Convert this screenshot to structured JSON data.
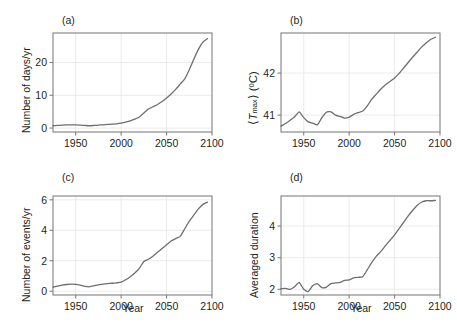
{
  "figure": {
    "panel_count": 4,
    "line_color": "#6e6e6e",
    "frame_color": "#808080",
    "grid_color": "#e6e6e6",
    "background": "#ffffff"
  },
  "panels": {
    "a": {
      "label": "(a)",
      "ylabel": "Number of days/yr",
      "xlabel": "",
      "ytick_labels": [
        "0",
        "10",
        "20"
      ],
      "xtick_labels": [
        "1950",
        "2000",
        "2050",
        "2100"
      ]
    },
    "b": {
      "label": "(b)",
      "ylabel_open": "⟨",
      "ylabel_t": "T",
      "ylabel_sub": "max",
      "ylabel_close": "⟩ (ºC)",
      "ylabel": "⟨Tmax⟩ (ºC)",
      "xlabel": "",
      "ytick_labels": [
        "41",
        "42"
      ],
      "xtick_labels": [
        "1950",
        "2000",
        "2050",
        "2100"
      ]
    },
    "c": {
      "label": "(c)",
      "ylabel": "Number of events/yr",
      "xlabel": "Year",
      "ytick_labels": [
        "0",
        "2",
        "4",
        "6"
      ],
      "xtick_labels": [
        "1950",
        "2000",
        "2050",
        "2100"
      ]
    },
    "d": {
      "label": "(d)",
      "ylabel": "Averaged duration",
      "xlabel": "Year",
      "ytick_labels": [
        "2",
        "3",
        "4"
      ],
      "xtick_labels": [
        "1950",
        "2000",
        "2050",
        "2100"
      ]
    }
  },
  "chart_data": [
    {
      "type": "line",
      "panel": "a",
      "title": "(a)",
      "xlabel": "",
      "ylabel": "Number of days/yr",
      "xlim": [
        1925,
        2100
      ],
      "ylim": [
        -1.2,
        29
      ],
      "xticks": [
        1950,
        2000,
        2050,
        2100
      ],
      "yticks": [
        0,
        10,
        20
      ],
      "grid": true,
      "legend": "none",
      "x": [
        1925,
        1930,
        1935,
        1940,
        1945,
        1950,
        1955,
        1960,
        1965,
        1970,
        1975,
        1980,
        1985,
        1990,
        1995,
        2000,
        2005,
        2010,
        2015,
        2020,
        2025,
        2030,
        2035,
        2040,
        2045,
        2050,
        2055,
        2060,
        2065,
        2070,
        2075,
        2080,
        2085,
        2090,
        2095
      ],
      "values": [
        0.7,
        0.8,
        0.9,
        1.0,
        1.0,
        1.0,
        0.9,
        0.8,
        0.7,
        0.8,
        0.9,
        1.0,
        1.1,
        1.2,
        1.3,
        1.5,
        1.8,
        2.2,
        2.7,
        3.4,
        4.6,
        5.8,
        6.5,
        7.2,
        8.1,
        9.2,
        10.4,
        11.8,
        13.4,
        15.0,
        17.8,
        21.0,
        24.0,
        26.2,
        27.3
      ]
    },
    {
      "type": "line",
      "panel": "b",
      "title": "(b)",
      "xlabel": "",
      "ylabel": "⟨Tmax⟩ (ºC)",
      "xlim": [
        1925,
        2100
      ],
      "ylim": [
        40.6,
        42.95
      ],
      "xticks": [
        1950,
        2000,
        2050,
        2100
      ],
      "yticks": [
        41,
        42
      ],
      "grid": true,
      "legend": "none",
      "x": [
        1925,
        1930,
        1935,
        1940,
        1945,
        1950,
        1955,
        1960,
        1965,
        1970,
        1975,
        1980,
        1985,
        1990,
        1995,
        2000,
        2005,
        2010,
        2015,
        2020,
        2025,
        2030,
        2035,
        2040,
        2045,
        2050,
        2055,
        2060,
        2065,
        2070,
        2075,
        2080,
        2085,
        2090,
        2095
      ],
      "values": [
        40.74,
        40.8,
        40.88,
        40.96,
        41.08,
        40.94,
        40.84,
        40.81,
        40.77,
        40.94,
        41.07,
        41.08,
        41.0,
        40.97,
        40.93,
        40.95,
        41.02,
        41.06,
        41.1,
        41.22,
        41.38,
        41.5,
        41.62,
        41.72,
        41.8,
        41.88,
        41.99,
        42.12,
        42.25,
        42.38,
        42.5,
        42.62,
        42.72,
        42.8,
        42.85
      ]
    },
    {
      "type": "line",
      "panel": "c",
      "title": "(c)",
      "xlabel": "Year",
      "ylabel": "Number of events/yr",
      "xlim": [
        1925,
        2100
      ],
      "ylim": [
        -0.25,
        6.25
      ],
      "xticks": [
        1950,
        2000,
        2050,
        2100
      ],
      "yticks": [
        0,
        2,
        4,
        6
      ],
      "grid": true,
      "legend": "none",
      "x": [
        1925,
        1930,
        1935,
        1940,
        1945,
        1950,
        1955,
        1960,
        1965,
        1970,
        1975,
        1980,
        1985,
        1990,
        1995,
        2000,
        2005,
        2010,
        2015,
        2020,
        2025,
        2030,
        2035,
        2040,
        2045,
        2050,
        2055,
        2060,
        2065,
        2070,
        2075,
        2080,
        2085,
        2090,
        2095
      ],
      "values": [
        0.26,
        0.34,
        0.4,
        0.44,
        0.46,
        0.45,
        0.4,
        0.32,
        0.29,
        0.35,
        0.42,
        0.46,
        0.5,
        0.52,
        0.55,
        0.6,
        0.75,
        0.95,
        1.2,
        1.5,
        1.95,
        2.1,
        2.3,
        2.55,
        2.8,
        3.05,
        3.3,
        3.45,
        3.6,
        4.1,
        4.6,
        5.0,
        5.4,
        5.7,
        5.85
      ]
    },
    {
      "type": "line",
      "panel": "d",
      "title": "(d)",
      "xlabel": "Year",
      "ylabel": "Averaged duration",
      "xlim": [
        1925,
        2100
      ],
      "ylim": [
        1.82,
        4.95
      ],
      "xticks": [
        1950,
        2000,
        2050,
        2100
      ],
      "yticks": [
        2,
        3,
        4
      ],
      "grid": true,
      "legend": "none",
      "x": [
        1925,
        1930,
        1935,
        1940,
        1945,
        1950,
        1955,
        1960,
        1965,
        1970,
        1975,
        1980,
        1985,
        1990,
        1995,
        2000,
        2005,
        2010,
        2015,
        2020,
        2025,
        2030,
        2035,
        2040,
        2045,
        2050,
        2055,
        2060,
        2065,
        2070,
        2075,
        2080,
        2085,
        2090,
        2095
      ],
      "values": [
        2.02,
        2.03,
        2.0,
        2.08,
        2.22,
        2.0,
        1.93,
        2.12,
        2.18,
        2.05,
        2.07,
        2.18,
        2.2,
        2.22,
        2.28,
        2.3,
        2.36,
        2.38,
        2.4,
        2.62,
        2.85,
        3.05,
        3.2,
        3.38,
        3.55,
        3.72,
        3.92,
        4.12,
        4.32,
        4.5,
        4.66,
        4.76,
        4.8,
        4.8,
        4.81
      ]
    }
  ]
}
